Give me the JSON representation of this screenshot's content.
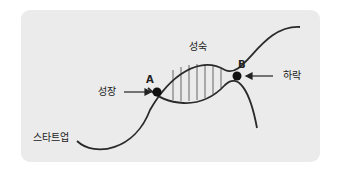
{
  "diagram": {
    "type": "lifecycle-curve",
    "labels": {
      "startup": "스타트업",
      "growth": "성장",
      "maturity": "성숙",
      "decline": "하락"
    },
    "points": {
      "a": "A",
      "b": "B"
    },
    "colors": {
      "panel": "#ebebeb",
      "line": "#2a2a2a",
      "text": "#222222"
    }
  }
}
